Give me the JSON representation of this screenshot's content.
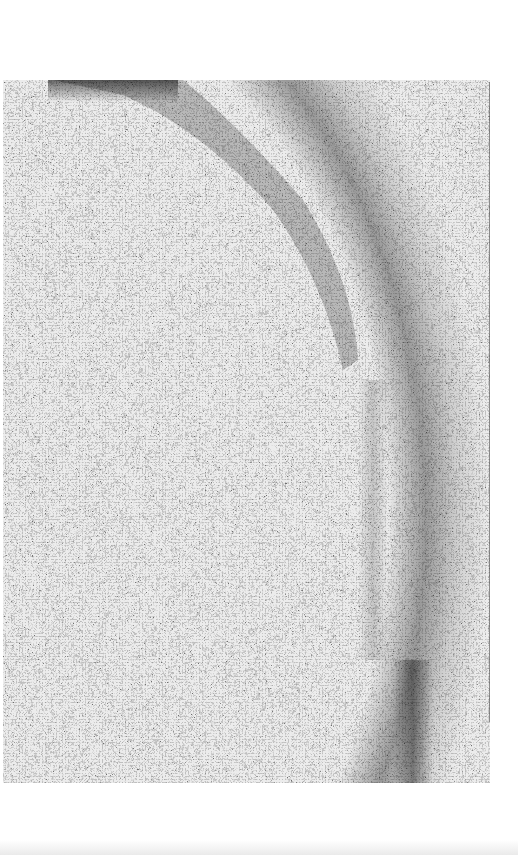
{
  "image": {
    "description": "Grayscale grainy paper/noise texture with a darker diagonal arc band from top-center curving down along the right side",
    "colors": {
      "background": "#ffffff",
      "texture_light": "#e9e9e9",
      "texture_dark": "#1e1e1e"
    }
  }
}
